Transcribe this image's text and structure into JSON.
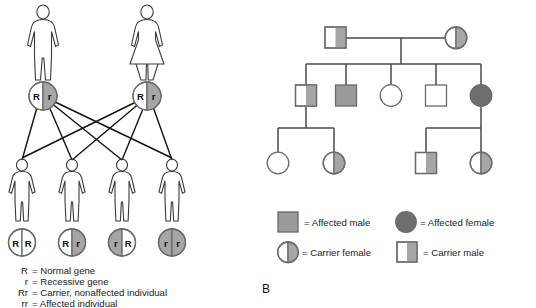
{
  "figure": {
    "panel_a": {
      "parents": [
        {
          "sex": "male",
          "genotype_left": "R",
          "genotype_right": "r",
          "fill_left": "white",
          "fill_right": "gray"
        },
        {
          "sex": "female",
          "genotype_left": "R",
          "genotype_right": "r",
          "fill_left": "white",
          "fill_right": "gray"
        }
      ],
      "offspring": [
        {
          "genotype_left": "R",
          "genotype_right": "R",
          "fill_left": "white",
          "fill_right": "white",
          "label": "RR"
        },
        {
          "genotype_left": "R",
          "genotype_right": "r",
          "fill_left": "white",
          "fill_right": "gray",
          "label": "Rr"
        },
        {
          "genotype_left": "r",
          "genotype_right": "R",
          "fill_left": "gray",
          "fill_right": "white",
          "label": "rR"
        },
        {
          "genotype_left": "r",
          "genotype_right": "r",
          "fill_left": "gray",
          "fill_right": "gray",
          "label": "rr"
        }
      ],
      "key": [
        {
          "symbol": "R",
          "text": "= Normal gene"
        },
        {
          "symbol": "r",
          "text": "= Recessive gene"
        },
        {
          "symbol": "Rr",
          "text": "= Carrier, nonaffected individual"
        },
        {
          "symbol": "rr",
          "text": "= Affected individual"
        }
      ]
    },
    "panel_b": {
      "letter": "B",
      "generation_1": [
        {
          "sex": "male",
          "status": "carrier"
        },
        {
          "sex": "female",
          "status": "carrier"
        }
      ],
      "generation_2": [
        {
          "sex": "male",
          "status": "carrier"
        },
        {
          "sex": "male",
          "status": "affected"
        },
        {
          "sex": "female",
          "status": "normal"
        },
        {
          "sex": "male",
          "status": "normal"
        },
        {
          "sex": "female",
          "status": "affected"
        }
      ],
      "generation_3": [
        {
          "sex": "female",
          "status": "normal"
        },
        {
          "sex": "female",
          "status": "carrier"
        },
        {
          "sex": "male",
          "status": "carrier"
        },
        {
          "sex": "female",
          "status": "carrier"
        }
      ],
      "legend": [
        {
          "symbol": "affected-male",
          "text": "= Affected male"
        },
        {
          "symbol": "affected-female",
          "text": "= Affected female"
        },
        {
          "symbol": "carrier-female",
          "text": "= Carrier female"
        },
        {
          "symbol": "carrier-male",
          "text": "= Carrier male"
        }
      ]
    }
  },
  "colors": {
    "carrier_gray": "#a6a6a6",
    "affected_male_gray": "#9a9a9a",
    "affected_female_gray": "#6e6e6e",
    "white": "#ffffff",
    "outline": "#6b6b6b",
    "line": "#4a4a4a",
    "text": "#1a1a1a"
  }
}
